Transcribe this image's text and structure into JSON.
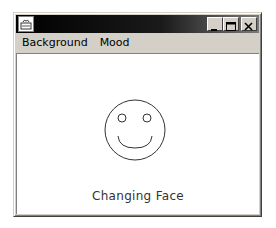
{
  "window": {
    "title": "",
    "controls": {
      "minimize": "minimize",
      "maximize": "maximize",
      "close": "close"
    }
  },
  "menubar": {
    "items": [
      {
        "label": "Background"
      },
      {
        "label": "Mood"
      }
    ]
  },
  "content": {
    "caption": "Changing Face",
    "face": {
      "mood": "happy",
      "stroke_color": "#333333",
      "background": "#ffffff"
    }
  },
  "colors": {
    "titlebar_start": "#000000",
    "titlebar_end": "#7a7a7a",
    "chrome": "#d4d0c8",
    "content_bg": "#ffffff"
  }
}
